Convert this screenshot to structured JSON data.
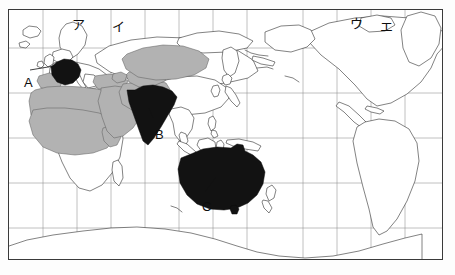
{
  "figure": {
    "type": "world-map",
    "projection_note": "Pacific-centred cylindrical world map with latitude/longitude graticule",
    "frame": {
      "x": 8,
      "y": 9,
      "width": 435,
      "height": 251
    }
  },
  "legend_colors": {
    "dark_fill": "#121212",
    "shaded_fill": "#b2b2b2",
    "plain_fill": "#ffffff",
    "coastline": "#1c1c1c",
    "grid": "#8d8d8d",
    "frame": "#3a3a3a",
    "label_text": "#0d0d0d"
  },
  "markers": {
    "letters": [
      {
        "id": "A",
        "label": "A",
        "x": 15,
        "y": 66,
        "points_to": "france",
        "fill": "dark",
        "leader": {
          "x1": 29,
          "y1": 69,
          "x2": 50,
          "y2": 63
        }
      },
      {
        "id": "B",
        "label": "B",
        "x": 146,
        "y": 118,
        "points_to": "india",
        "fill": "dark",
        "leader": {
          "x1": 152,
          "y1": 117,
          "x2": 148,
          "y2": 108
        }
      },
      {
        "id": "C",
        "label": "C",
        "x": 193,
        "y": 190,
        "points_to": "australia",
        "fill": "dark",
        "leader": {
          "x1": 203,
          "y1": 191,
          "x2": 214,
          "y2": 176
        }
      }
    ],
    "katakana": [
      {
        "id": "a",
        "label": "ア",
        "x": 63,
        "y": 8,
        "region": "northern-europe-scandinavia"
      },
      {
        "id": "i",
        "label": "イ",
        "x": 103,
        "y": 10,
        "region": "northern-russia-arctic"
      },
      {
        "id": "u",
        "label": "ウ",
        "x": 341,
        "y": 7,
        "region": "northern-canada-west"
      },
      {
        "id": "e",
        "label": "エ",
        "x": 371,
        "y": 10,
        "region": "northern-canada-east"
      }
    ]
  },
  "graticule": {
    "vertical_lines_x": [
      42,
      76,
      110,
      144,
      178,
      212,
      246,
      280,
      302,
      336,
      370,
      404,
      438
    ],
    "horizontal_lines_y": [
      47,
      92,
      137,
      182,
      227
    ],
    "equator_y": 137,
    "show_grid": true
  },
  "regions": {
    "dark_highlighted": [
      {
        "name": "France",
        "marker": "A"
      },
      {
        "name": "India",
        "marker": "B"
      },
      {
        "name": "Australia",
        "marker": "C"
      }
    ],
    "grey_shaded_band": [
      "Morocco",
      "Algeria",
      "Tunisia",
      "Libya",
      "Egypt",
      "Mauritania",
      "Mali",
      "Niger",
      "Chad",
      "Sudan",
      "Saudi Arabia",
      "Yemen",
      "Oman",
      "Iraq",
      "Iran",
      "Syria",
      "Jordan",
      "Turkey",
      "Afghanistan",
      "Pakistan",
      "Turkmenistan",
      "Uzbekistan",
      "Kazakhstan",
      "Kyrgyzstan",
      "Tajikistan",
      "Azerbaijan",
      "Somalia"
    ],
    "plain_outline": [
      "Europe",
      "Russia",
      "China",
      "Mongolia",
      "Southeast Asia",
      "Japan",
      "Sub-Saharan Africa",
      "North America",
      "South America",
      "Antarctica",
      "Greenland",
      "New Zealand",
      "Indonesia",
      "Philippines"
    ]
  }
}
